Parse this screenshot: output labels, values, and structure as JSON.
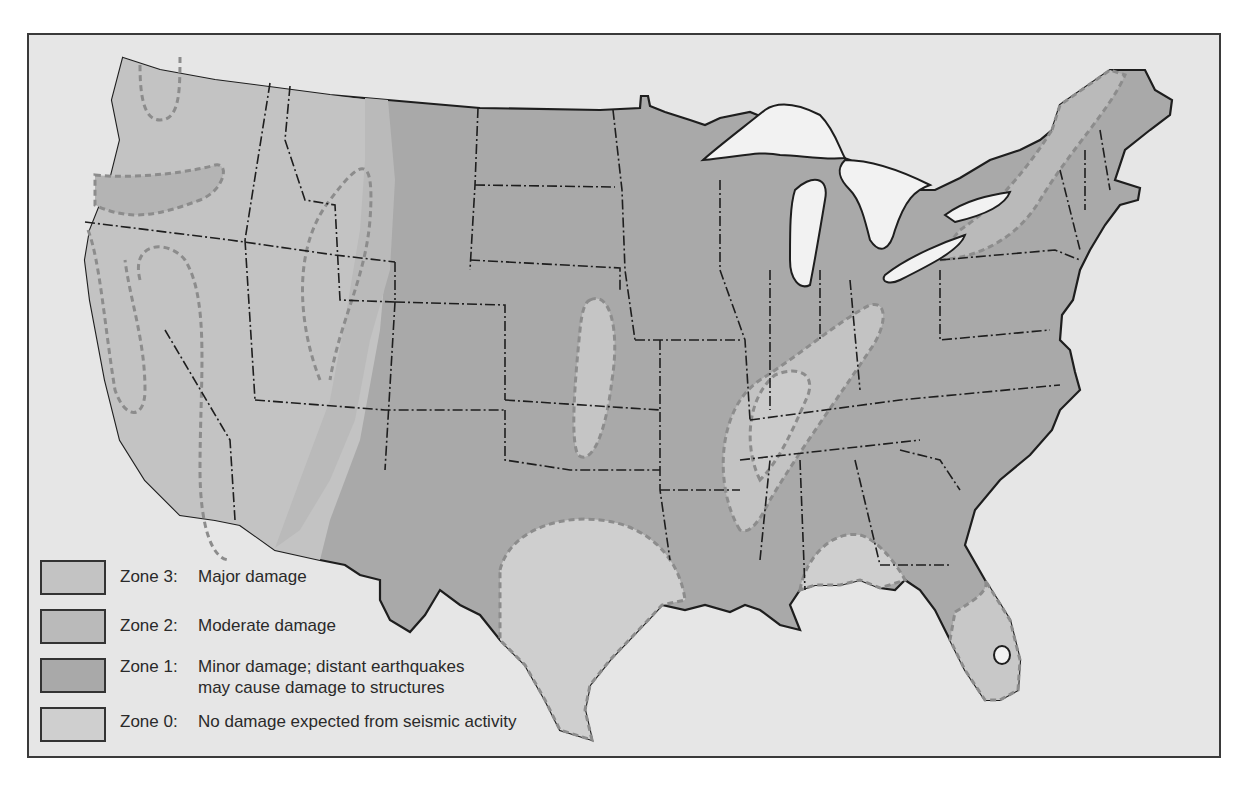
{
  "colors": {
    "page_background": "#ffffff",
    "frame_background": "#e6e6e6",
    "frame_border": "#3a3a3a",
    "water": "#f2f2f2",
    "zone_3": "#c3c3c3",
    "zone_2": "#bababa",
    "zone_1": "#a9a9a9",
    "zone_0": "#cfcfcf",
    "outline": "#1e1e1e",
    "zone_boundary_dash": "#8c8c8c"
  },
  "map": {
    "subject": "Contiguous United States seismic risk zones",
    "features": [
      "state boundaries (dash-dot)",
      "zone boundaries (dashed gray)",
      "Great Lakes (white)",
      "Lake Okeechobee (white)"
    ]
  },
  "legend": {
    "items": [
      {
        "zone": "Zone 3:",
        "description": "Major damage",
        "description_line2": "",
        "color_key": "zone_3"
      },
      {
        "zone": "Zone 2:",
        "description": "Moderate damage",
        "description_line2": "",
        "color_key": "zone_2"
      },
      {
        "zone": "Zone 1:",
        "description": "Minor damage; distant earthquakes",
        "description_line2": "may cause damage to structures",
        "color_key": "zone_1"
      },
      {
        "zone": "Zone 0:",
        "description": "No damage expected  from seismic activity",
        "description_line2": "",
        "color_key": "zone_0"
      }
    ]
  }
}
